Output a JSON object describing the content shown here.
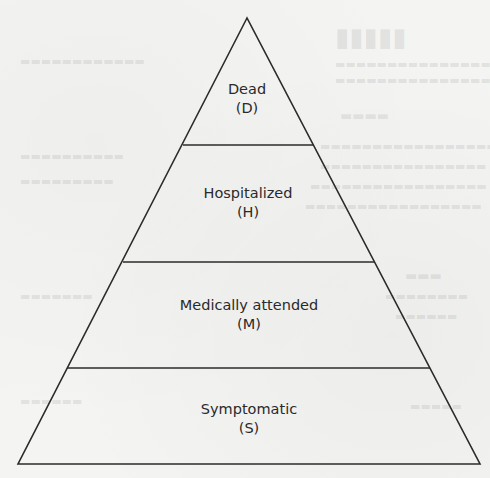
{
  "diagram": {
    "type": "pyramid",
    "levels": [
      {
        "name": "Dead",
        "code": "(D)"
      },
      {
        "name": "Hospitalized",
        "code": "(H)"
      },
      {
        "name": "Medically attended",
        "code": "(M)"
      },
      {
        "name": "Symptomatic",
        "code": "(S)"
      }
    ],
    "colors": {
      "line": "#2b2b2b",
      "text": "#2a2a2a",
      "background": "#f4f4f3"
    }
  }
}
